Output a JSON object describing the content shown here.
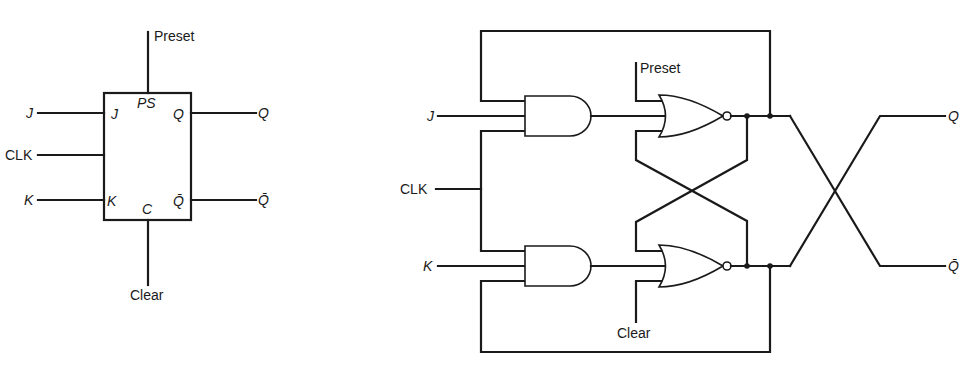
{
  "block_symbol": {
    "title": "JK flip-flop block symbol",
    "external_labels": {
      "preset": "Preset",
      "clear": "Clear",
      "j": "J",
      "clk": "CLK",
      "k": "K",
      "q": "Q",
      "qbar": "Q̄"
    },
    "pin_labels": {
      "ps": "PS",
      "c": "C",
      "j": "J",
      "k": "K",
      "q": "Q",
      "qbar": "Q̄"
    }
  },
  "gate_circuit": {
    "title": "JK flip-flop gate-level circuit",
    "labels": {
      "j": "J",
      "clk": "CLK",
      "k": "K",
      "preset": "Preset",
      "clear": "Clear",
      "q": "Q",
      "qbar": "Q̄"
    },
    "gates": [
      {
        "type": "AND",
        "name": "and-gate-j"
      },
      {
        "type": "AND",
        "name": "and-gate-k"
      },
      {
        "type": "NOR",
        "name": "nor-gate-top"
      },
      {
        "type": "NOR",
        "name": "nor-gate-bottom"
      }
    ]
  },
  "colors": {
    "line": "#1a1a1a",
    "background": "#ffffff"
  }
}
